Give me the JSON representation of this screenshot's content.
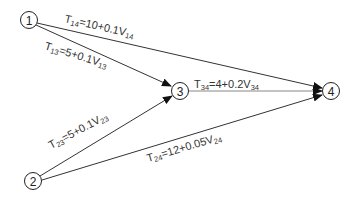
{
  "diagram": {
    "type": "network",
    "nodes": [
      {
        "id": "1",
        "label": "1",
        "x": 29,
        "y": 20
      },
      {
        "id": "2",
        "label": "2",
        "x": 33,
        "y": 181
      },
      {
        "id": "3",
        "label": "3",
        "x": 180,
        "y": 91
      },
      {
        "id": "4",
        "label": "4",
        "x": 331,
        "y": 91
      }
    ],
    "edges": [
      {
        "from": "1",
        "to": "4",
        "T": "T",
        "sub": "14",
        "eq": "=10+0.1V",
        "vsub": "14"
      },
      {
        "from": "1",
        "to": "3",
        "T": "T",
        "sub": "13",
        "eq": "=5+0.1V",
        "vsub": "13"
      },
      {
        "from": "3",
        "to": "4",
        "T": "T",
        "sub": "34",
        "eq": "=4+0.2V",
        "vsub": "34"
      },
      {
        "from": "2",
        "to": "3",
        "T": "T",
        "sub": "23",
        "eq": "=5+0.1V",
        "vsub": "23"
      },
      {
        "from": "2",
        "to": "4",
        "T": "T",
        "sub": "24",
        "eq": "=12+0.05V",
        "vsub": "24"
      }
    ]
  }
}
